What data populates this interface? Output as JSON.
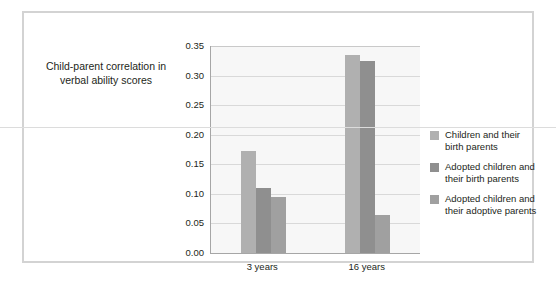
{
  "chart_data": {
    "type": "bar",
    "title": "",
    "xlabel": "",
    "ylabel": "Child-parent correlation\nin verbal ability scores",
    "categories": [
      "3 years",
      "16 years"
    ],
    "ylim": [
      0.0,
      0.35
    ],
    "ytick_labels": [
      "0.35",
      "0.30",
      "0.25",
      "0.20",
      "0.15",
      "0.10",
      "0.05",
      "0.00"
    ],
    "ytick_values": [
      0.35,
      0.3,
      0.25,
      0.2,
      0.15,
      0.1,
      0.05,
      0.0
    ],
    "grid": true,
    "legend_position": "right",
    "series": [
      {
        "name": "Children and their\nbirth parents",
        "color": "#b0b0b0",
        "values": [
          0.173,
          0.335
        ]
      },
      {
        "name": "Adopted children and\ntheir birth parents",
        "color": "#8f8f8f",
        "values": [
          0.11,
          0.324
        ]
      },
      {
        "name": "Adopted children and\ntheir adoptive parents",
        "color": "#a0a0a0",
        "values": [
          0.095,
          0.065
        ]
      }
    ]
  },
  "figure": {
    "axis_title": "Child-parent correlation\nin verbal ability scores",
    "frame_color": "#d3d3d3",
    "plot_background": "#f7f7f7"
  }
}
